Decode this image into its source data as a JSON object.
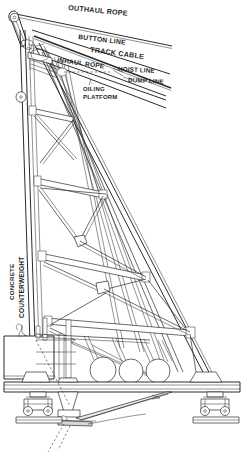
{
  "drawing": {
    "title": "Cableway Head Tower Elevation",
    "type": "engineering-line-drawing",
    "background_color": "#ffffff",
    "ink_color": "#2b2b2b"
  },
  "labels": {
    "outhaul_rope": "OUTHAUL ROPE",
    "button_line": "BUTTON LINE",
    "track_cable": "TRACK CABLE",
    "inhaul_rope": "INHAUL ROPE",
    "hoist_line": "HOIST LINE",
    "dump_line": "DUMP LINE",
    "oiling_platform_1": "OILING",
    "oiling_platform_2": "PLATFORM",
    "counterweight_1": "CONCRETE",
    "counterweight_2": "COUNTERWEIGHT"
  },
  "parts": {
    "mast_head_sheave": "mast-head-sheave-assembly",
    "mast": "inclined-lattice-mast",
    "backstay": "backstay-leg",
    "lattice_bracing": "lattice-cross-bracing",
    "counterweight_block": "concrete-counterweight-block",
    "winch_drums": "winch-drum-group",
    "drum_count": 3,
    "base_girder": "base-girder",
    "bogie_left": "rail-bogie-left",
    "bogie_right": "rail-bogie-right",
    "rail_plate_left": "rail-base-plate-left",
    "rail_plate_right": "rail-base-plate-right",
    "center_pivot": "center-pivot-foot",
    "ground_line": "ground-line"
  }
}
